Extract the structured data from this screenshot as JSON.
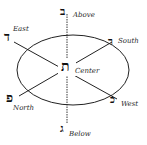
{
  "diagram": {
    "type": "directional-seal",
    "colors": {
      "line": "#222222",
      "background": "#ffffff"
    },
    "nodes": [
      {
        "id": "above",
        "label": "Above",
        "letter": "ב"
      },
      {
        "id": "below",
        "label": "Below",
        "letter": "ג"
      },
      {
        "id": "east",
        "label": "East",
        "letter": "ד"
      },
      {
        "id": "west",
        "label": "West",
        "letter": "כ"
      },
      {
        "id": "north",
        "label": "North",
        "letter": "פ"
      },
      {
        "id": "south",
        "label": "South",
        "letter": "ר"
      },
      {
        "id": "center",
        "label": "Center",
        "letter": "ת"
      }
    ]
  }
}
